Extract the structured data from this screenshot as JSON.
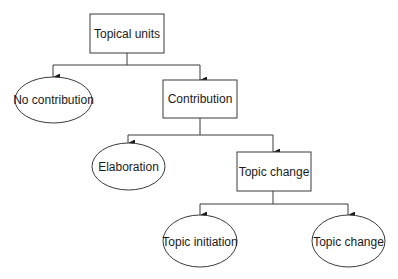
{
  "diagram": {
    "type": "tree",
    "nodes": {
      "topical_units": {
        "label": "Topical units",
        "shape": "rectangle"
      },
      "no_contribution": {
        "label": "No contribution",
        "shape": "ellipse"
      },
      "contribution": {
        "label": "Contribution",
        "shape": "rectangle"
      },
      "elaboration": {
        "label": "Elaboration",
        "shape": "ellipse"
      },
      "topic_change_box": {
        "label": "Topic change",
        "shape": "rectangle"
      },
      "topic_initiation": {
        "label": "Topic initiation",
        "shape": "ellipse"
      },
      "topic_change_leaf": {
        "label": "Topic change",
        "shape": "ellipse"
      }
    },
    "edges": [
      {
        "from": "Topical units",
        "to": "No contribution"
      },
      {
        "from": "Topical units",
        "to": "Contribution"
      },
      {
        "from": "Contribution",
        "to": "Elaboration"
      },
      {
        "from": "Contribution",
        "to": "Topic change"
      },
      {
        "from": "Topic change",
        "to": "Topic initiation"
      },
      {
        "from": "Topic change",
        "to": "Topic change (leaf)"
      }
    ],
    "colors": {
      "stroke": "#3a3a3a",
      "fill": "#ffffff",
      "text": "#1a1a1a"
    }
  }
}
